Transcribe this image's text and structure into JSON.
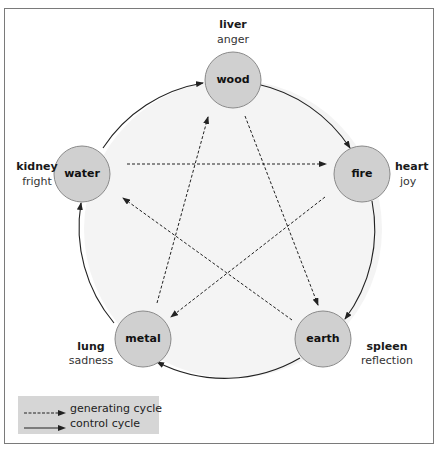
{
  "diagram": {
    "colors": {
      "node_fill": "#d0d0d0",
      "node_stroke": "#8a8a8a",
      "ring_fill": "#f4f4f4",
      "line": "#222222"
    },
    "nodes": [
      {
        "id": "wood",
        "element": "wood",
        "organ": "liver",
        "emotion": "anger"
      },
      {
        "id": "fire",
        "element": "fire",
        "organ": "heart",
        "emotion": "joy"
      },
      {
        "id": "earth",
        "element": "earth",
        "organ": "spleen",
        "emotion": "reflection"
      },
      {
        "id": "metal",
        "element": "metal",
        "organ": "lung",
        "emotion": "sadness"
      },
      {
        "id": "water",
        "element": "water",
        "organ": "kidney",
        "emotion": "fright"
      }
    ],
    "edges": {
      "control_cycle": [
        {
          "from": "water",
          "to": "wood"
        },
        {
          "from": "wood",
          "to": "fire"
        },
        {
          "from": "fire",
          "to": "earth"
        },
        {
          "from": "earth",
          "to": "metal"
        },
        {
          "from": "metal",
          "to": "water"
        }
      ],
      "generating_cycle": [
        {
          "from": "water",
          "to": "fire"
        },
        {
          "from": "fire",
          "to": "metal"
        },
        {
          "from": "metal",
          "to": "wood"
        },
        {
          "from": "wood",
          "to": "earth"
        },
        {
          "from": "earth",
          "to": "water"
        }
      ]
    }
  },
  "legend": {
    "items": [
      {
        "style": "dashed",
        "label": "generating cycle"
      },
      {
        "style": "solid",
        "label": "control cycle"
      }
    ]
  }
}
